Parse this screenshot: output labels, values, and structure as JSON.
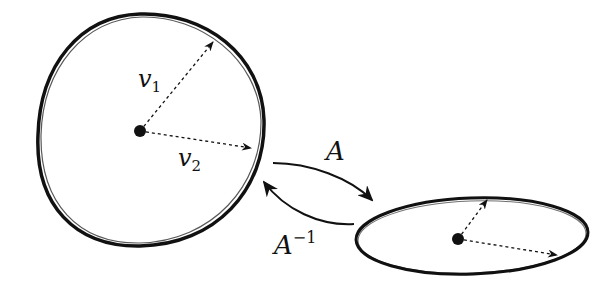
{
  "diagram": {
    "circle": {
      "center": [
        140,
        131
      ],
      "radius": 117,
      "vectors": [
        {
          "label": "v",
          "subscript": "1",
          "tip": [
            213,
            42
          ]
        },
        {
          "label": "v",
          "subscript": "2",
          "tip": [
            250,
            148
          ]
        }
      ]
    },
    "ellipse": {
      "center": [
        472,
        236
      ],
      "rx": 116,
      "ry": 38,
      "dot": [
        458,
        239
      ],
      "vectors": [
        {
          "tip": [
            487,
            200
          ]
        },
        {
          "tip": [
            556,
            255
          ]
        }
      ]
    },
    "arrows": [
      {
        "label": "A",
        "superscript": "",
        "direction": "circle-to-ellipse"
      },
      {
        "label": "A",
        "superscript": "−1",
        "direction": "ellipse-to-circle"
      }
    ],
    "colors": {
      "stroke": "#111111",
      "background": "#ffffff"
    }
  }
}
